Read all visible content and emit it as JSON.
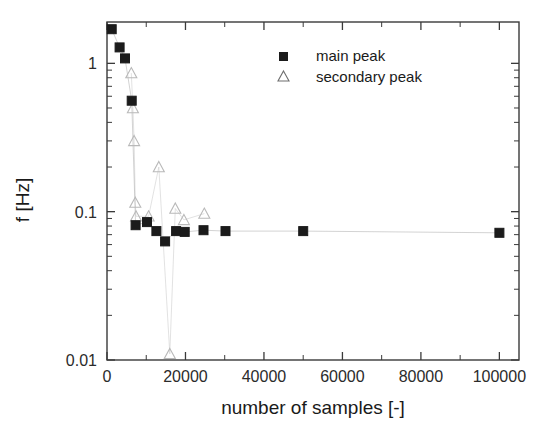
{
  "chart_data": {
    "type": "scatter",
    "title": "",
    "xlabel": "number of samples [-]",
    "ylabel": "f [Hz]",
    "xlim": [
      0,
      105000
    ],
    "ylim": [
      0.01,
      1.9
    ],
    "yscale": "log",
    "xscale": "linear",
    "grid": false,
    "legend_position": "top-right",
    "xticks": [
      0,
      20000,
      40000,
      60000,
      80000,
      100000
    ],
    "xticklabels": [
      "0",
      "20000",
      "40000",
      "60000",
      "80000",
      "100000"
    ],
    "yticks": [
      0.01,
      0.1,
      1
    ],
    "yticklabels": [
      "0.01",
      "0.1",
      "1"
    ],
    "x_minor_tick_step": 10000,
    "series": [
      {
        "name": "main peak",
        "marker": "filled-square",
        "marker_color": "#1b1b1b",
        "points": [
          {
            "x": 1200,
            "y": 1.7
          },
          {
            "x": 3200,
            "y": 1.28
          },
          {
            "x": 4600,
            "y": 1.08
          },
          {
            "x": 6300,
            "y": 0.56
          },
          {
            "x": 7300,
            "y": 0.081
          },
          {
            "x": 10200,
            "y": 0.085
          },
          {
            "x": 12600,
            "y": 0.074
          },
          {
            "x": 14800,
            "y": 0.063
          },
          {
            "x": 17600,
            "y": 0.074
          },
          {
            "x": 19800,
            "y": 0.073
          },
          {
            "x": 24600,
            "y": 0.075
          },
          {
            "x": 30200,
            "y": 0.074
          },
          {
            "x": 50000,
            "y": 0.074
          },
          {
            "x": 100000,
            "y": 0.072
          }
        ]
      },
      {
        "name": "secondary peak",
        "marker": "open-triangle",
        "marker_color": "#b9b9b9",
        "points": [
          {
            "x": 6200,
            "y": 0.86
          },
          {
            "x": 6600,
            "y": 0.5
          },
          {
            "x": 6900,
            "y": 0.3
          },
          {
            "x": 7200,
            "y": 0.115
          },
          {
            "x": 7400,
            "y": 0.093
          },
          {
            "x": 10600,
            "y": 0.093
          },
          {
            "x": 13200,
            "y": 0.2
          },
          {
            "x": 16000,
            "y": 0.011
          },
          {
            "x": 17400,
            "y": 0.105
          },
          {
            "x": 19600,
            "y": 0.088
          },
          {
            "x": 24800,
            "y": 0.097
          }
        ]
      }
    ]
  },
  "legend": {
    "entries": [
      {
        "label": "main peak",
        "marker": "filled-square"
      },
      {
        "label": "secondary peak",
        "marker": "open-triangle"
      }
    ]
  },
  "axes": {
    "x_title": "number of samples [-]",
    "y_title": "f [Hz]",
    "x_labels": [
      "0",
      "20000",
      "40000",
      "60000",
      "80000",
      "100000"
    ],
    "y_labels": [
      "1",
      "0.1",
      "0.01"
    ]
  }
}
